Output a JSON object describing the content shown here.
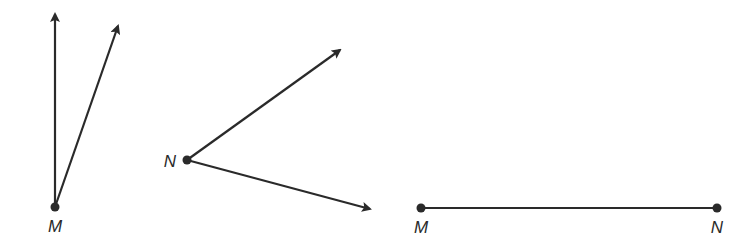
{
  "diagram": {
    "stroke_color": "#2a2a2a",
    "figures": [
      {
        "id": "angle-at-M",
        "type": "angle",
        "vertex": {
          "label": "M",
          "x": 55,
          "y": 207
        },
        "label_pos": {
          "x": 55,
          "y": 226
        },
        "rays": [
          {
            "to": {
              "x": 55,
              "y": 11
            },
            "arrow": true
          },
          {
            "to": {
              "x": 120,
              "y": 23
            },
            "arrow": true
          }
        ]
      },
      {
        "id": "angle-at-N",
        "type": "angle",
        "vertex": {
          "label": "N",
          "x": 187,
          "y": 160
        },
        "label_pos": {
          "x": 170,
          "y": 161
        },
        "rays": [
          {
            "to": {
              "x": 343,
              "y": 48
            },
            "arrow": true
          },
          {
            "to": {
              "x": 373,
              "y": 210
            },
            "arrow": true
          }
        ]
      },
      {
        "id": "segment-MN",
        "type": "segment",
        "endpoints": [
          {
            "label": "M",
            "x": 421,
            "y": 208,
            "label_pos": {
              "x": 421,
              "y": 227
            }
          },
          {
            "label": "N",
            "x": 717,
            "y": 208,
            "label_pos": {
              "x": 717,
              "y": 227
            }
          }
        ]
      }
    ]
  }
}
